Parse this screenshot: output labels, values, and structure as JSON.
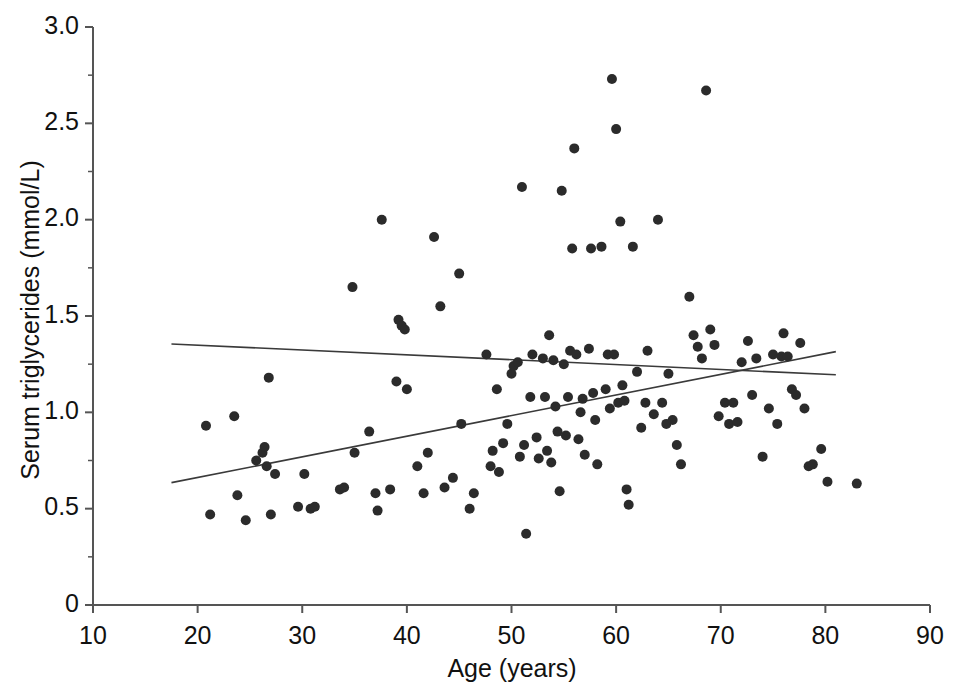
{
  "chart_data": {
    "type": "scatter",
    "title": "",
    "xlabel": "Age (years)",
    "ylabel": "Serum triglycerides  (mmol/L)",
    "xlim": [
      10,
      90
    ],
    "ylim": [
      0,
      3.0
    ],
    "xticks": [
      10,
      20,
      30,
      40,
      50,
      60,
      70,
      80,
      90
    ],
    "xtick_labels": [
      "10",
      "20",
      "30",
      "40",
      "50",
      "60",
      "70",
      "80",
      "90"
    ],
    "yticks": [
      0,
      0.5,
      1.0,
      1.5,
      2.0,
      2.5,
      3.0
    ],
    "ytick_labels": [
      "0",
      "0.5",
      "1.0",
      "1.5",
      "2.0",
      "2.5",
      "3.0"
    ],
    "y_minor_ticks": [
      0.25,
      0.75,
      1.25,
      1.75,
      2.25,
      2.75
    ],
    "grid": false,
    "legend": false,
    "marker_color": "#2b2b2b",
    "marker_size": 10,
    "line_color": "#3a3a3a",
    "axis_color": "#555555",
    "points": [
      [
        20.8,
        0.93
      ],
      [
        21.2,
        0.47
      ],
      [
        23.5,
        0.98
      ],
      [
        23.8,
        0.57
      ],
      [
        24.6,
        0.44
      ],
      [
        25.6,
        0.75
      ],
      [
        26.2,
        0.79
      ],
      [
        26.4,
        0.82
      ],
      [
        26.6,
        0.72
      ],
      [
        26.8,
        1.18
      ],
      [
        27.0,
        0.47
      ],
      [
        27.4,
        0.68
      ],
      [
        29.6,
        0.51
      ],
      [
        30.2,
        0.68
      ],
      [
        30.8,
        0.5
      ],
      [
        31.2,
        0.51
      ],
      [
        33.6,
        0.6
      ],
      [
        34.0,
        0.61
      ],
      [
        34.8,
        1.65
      ],
      [
        35.0,
        0.79
      ],
      [
        36.4,
        0.9
      ],
      [
        37.0,
        0.58
      ],
      [
        37.2,
        0.49
      ],
      [
        37.6,
        2.0
      ],
      [
        38.4,
        0.6
      ],
      [
        39.0,
        1.16
      ],
      [
        39.2,
        1.48
      ],
      [
        39.5,
        1.45
      ],
      [
        39.8,
        1.43
      ],
      [
        40.0,
        1.12
      ],
      [
        41.0,
        0.72
      ],
      [
        41.6,
        0.58
      ],
      [
        42.0,
        0.79
      ],
      [
        42.6,
        1.91
      ],
      [
        43.2,
        1.55
      ],
      [
        43.6,
        0.61
      ],
      [
        44.4,
        0.66
      ],
      [
        45.0,
        1.72
      ],
      [
        45.2,
        0.94
      ],
      [
        46.0,
        0.5
      ],
      [
        46.4,
        0.58
      ],
      [
        47.6,
        1.3
      ],
      [
        48.0,
        0.72
      ],
      [
        48.2,
        0.8
      ],
      [
        48.6,
        1.12
      ],
      [
        48.8,
        0.69
      ],
      [
        49.2,
        0.84
      ],
      [
        49.6,
        0.94
      ],
      [
        50.0,
        1.2
      ],
      [
        50.2,
        1.24
      ],
      [
        50.6,
        1.26
      ],
      [
        50.8,
        0.77
      ],
      [
        51.0,
        2.17
      ],
      [
        51.2,
        0.83
      ],
      [
        51.4,
        0.37
      ],
      [
        51.8,
        1.08
      ],
      [
        52.0,
        1.3
      ],
      [
        52.4,
        0.87
      ],
      [
        52.6,
        0.76
      ],
      [
        53.0,
        1.28
      ],
      [
        53.2,
        1.08
      ],
      [
        53.4,
        0.8
      ],
      [
        53.6,
        1.4
      ],
      [
        53.8,
        0.74
      ],
      [
        54.0,
        1.27
      ],
      [
        54.2,
        1.03
      ],
      [
        54.4,
        0.9
      ],
      [
        54.6,
        0.59
      ],
      [
        54.8,
        2.15
      ],
      [
        55.0,
        1.25
      ],
      [
        55.2,
        0.88
      ],
      [
        55.4,
        1.08
      ],
      [
        55.6,
        1.32
      ],
      [
        55.8,
        1.85
      ],
      [
        56.0,
        2.37
      ],
      [
        56.2,
        1.3
      ],
      [
        56.4,
        0.86
      ],
      [
        56.6,
        1.0
      ],
      [
        56.8,
        1.07
      ],
      [
        57.0,
        0.78
      ],
      [
        57.4,
        1.33
      ],
      [
        57.6,
        1.85
      ],
      [
        57.8,
        1.1
      ],
      [
        58.0,
        0.96
      ],
      [
        58.2,
        0.73
      ],
      [
        58.6,
        1.86
      ],
      [
        59.0,
        1.12
      ],
      [
        59.2,
        1.3
      ],
      [
        59.4,
        1.02
      ],
      [
        59.6,
        2.73
      ],
      [
        59.8,
        1.3
      ],
      [
        60.0,
        2.47
      ],
      [
        60.2,
        1.05
      ],
      [
        60.4,
        1.99
      ],
      [
        60.6,
        1.14
      ],
      [
        60.8,
        1.06
      ],
      [
        61.0,
        0.6
      ],
      [
        61.2,
        0.52
      ],
      [
        61.6,
        1.86
      ],
      [
        62.0,
        1.21
      ],
      [
        62.4,
        0.92
      ],
      [
        62.8,
        1.05
      ],
      [
        63.0,
        1.32
      ],
      [
        63.6,
        0.99
      ],
      [
        64.0,
        2.0
      ],
      [
        64.4,
        1.05
      ],
      [
        64.8,
        0.94
      ],
      [
        65.0,
        1.2
      ],
      [
        65.4,
        0.96
      ],
      [
        65.8,
        0.83
      ],
      [
        66.2,
        0.73
      ],
      [
        67.0,
        1.6
      ],
      [
        67.4,
        1.4
      ],
      [
        67.8,
        1.34
      ],
      [
        68.2,
        1.28
      ],
      [
        68.6,
        2.67
      ],
      [
        69.0,
        1.43
      ],
      [
        69.4,
        1.35
      ],
      [
        69.8,
        0.98
      ],
      [
        70.4,
        1.05
      ],
      [
        70.8,
        0.94
      ],
      [
        71.2,
        1.05
      ],
      [
        71.6,
        0.95
      ],
      [
        72.0,
        1.26
      ],
      [
        72.6,
        1.37
      ],
      [
        73.0,
        1.09
      ],
      [
        73.4,
        1.28
      ],
      [
        74.0,
        0.77
      ],
      [
        74.6,
        1.02
      ],
      [
        75.0,
        1.3
      ],
      [
        75.4,
        0.94
      ],
      [
        75.8,
        1.29
      ],
      [
        76.0,
        1.41
      ],
      [
        76.4,
        1.29
      ],
      [
        76.8,
        1.12
      ],
      [
        77.2,
        1.09
      ],
      [
        77.6,
        1.36
      ],
      [
        78.0,
        1.02
      ],
      [
        78.4,
        0.72
      ],
      [
        78.8,
        0.73
      ],
      [
        79.6,
        0.81
      ],
      [
        80.2,
        0.64
      ],
      [
        83.0,
        0.63
      ]
    ],
    "lines": [
      {
        "name": "men-regression-line",
        "x": [
          17.5,
          81.0
        ],
        "y": [
          1.355,
          1.195
        ]
      },
      {
        "name": "women-regression-line",
        "x": [
          17.5,
          81.0
        ],
        "y": [
          0.635,
          1.315
        ]
      }
    ]
  }
}
